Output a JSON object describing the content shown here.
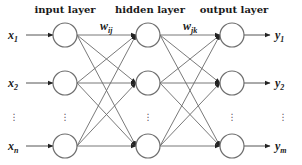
{
  "diagram": {
    "type": "neural-network",
    "layers": [
      {
        "id": "input",
        "label": "input layer",
        "x": 65
      },
      {
        "id": "hidden",
        "label": "hidden layer",
        "x": 148
      },
      {
        "id": "output",
        "label": "output layer",
        "x": 232
      }
    ],
    "node_rows_y": [
      35,
      83,
      146
    ],
    "node_radius": 12,
    "inputs": [
      {
        "base": "x",
        "sub": "1"
      },
      {
        "base": "x",
        "sub": "2"
      },
      {
        "base": "x",
        "sub": "n"
      }
    ],
    "outputs": [
      {
        "base": "y",
        "sub": "1"
      },
      {
        "base": "y",
        "sub": "2"
      },
      {
        "base": "y",
        "sub": "m"
      }
    ],
    "weights": [
      {
        "base": "w",
        "sub": "ij"
      },
      {
        "base": "w",
        "sub": "jk"
      }
    ],
    "ellipsis": "⋮",
    "colors": {
      "line": "#6a6a6a",
      "node_stroke": "#6e6e6e",
      "text": "#1a1a1a"
    }
  }
}
